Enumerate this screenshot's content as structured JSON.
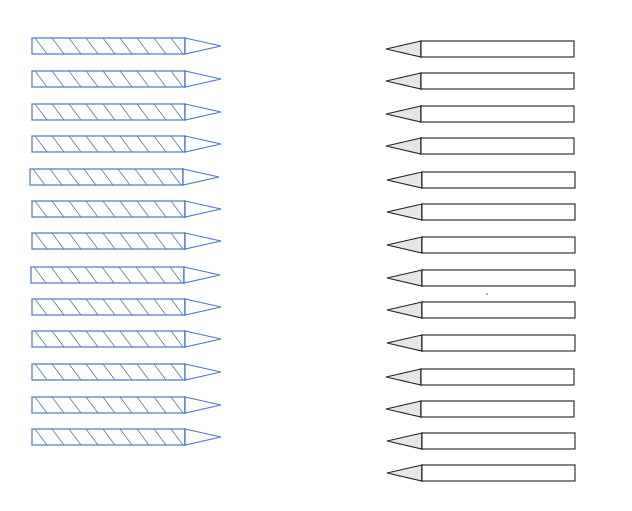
{
  "diagram": {
    "title": "",
    "left_group": {
      "label": "",
      "count": 13,
      "style": "hatched",
      "color": "#4a78c8",
      "direction": "tip-right",
      "body_x": 32,
      "body_w": 153,
      "tip_w": 36,
      "height": 16,
      "rows_y": [
        38,
        71,
        104,
        136,
        169,
        201,
        233,
        267,
        299,
        331,
        364,
        397,
        429
      ],
      "rows_x_offset": [
        0,
        0,
        0,
        0,
        -2,
        0,
        0,
        -1,
        0,
        0,
        0,
        0,
        0
      ]
    },
    "right_group": {
      "label": "",
      "count": 14,
      "style": "plain",
      "color": "#222222",
      "tip_fill": "#e6e6e6",
      "direction": "tip-left",
      "tip_x": 386,
      "tip_w": 35,
      "body_w": 153,
      "height": 16,
      "rows_y": [
        41,
        73,
        106,
        138,
        172,
        204,
        237,
        270,
        302,
        335,
        369,
        401,
        433,
        465
      ],
      "rows_x_offset": [
        0,
        0,
        0,
        0,
        1,
        1,
        1,
        1,
        1,
        1,
        0,
        0,
        1,
        1
      ]
    },
    "stray_dot": {
      "x": 487,
      "y": 294
    }
  }
}
